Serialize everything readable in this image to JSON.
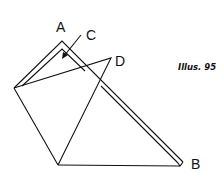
{
  "figure": {
    "caption": "Illus. 95",
    "labels": {
      "a": "A",
      "b": "B",
      "c": "C",
      "d": "D"
    },
    "stroke_color": "#111111",
    "background": "#ffffff"
  }
}
